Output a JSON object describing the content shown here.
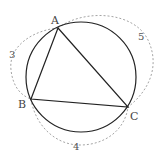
{
  "diagram": {
    "type": "geometry",
    "points": {
      "A": {
        "label": "A",
        "x": 58,
        "y": 28
      },
      "B": {
        "label": "B",
        "x": 31,
        "y": 99
      },
      "C": {
        "label": "C",
        "x": 128,
        "y": 107
      }
    },
    "circle": {
      "cx": 81,
      "cy": 77,
      "r": 55
    },
    "side_labels": {
      "AB": "3",
      "AC": "5",
      "BC": "4"
    },
    "colors": {
      "stroke": "#222222",
      "dashed": "#999999",
      "text": "#444444"
    }
  }
}
